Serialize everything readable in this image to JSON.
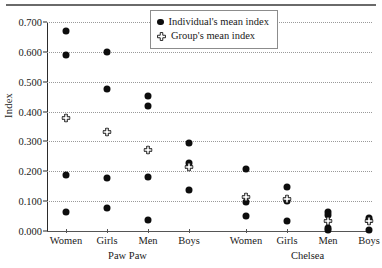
{
  "chart_data": {
    "type": "scatter",
    "title": "",
    "xlabel": "",
    "ylabel": "Index",
    "ylim": [
      0.0,
      0.7
    ],
    "yticks": [
      "0.000",
      "0.100",
      "0.200",
      "0.300",
      "0.400",
      "0.500",
      "0.600",
      "0.700"
    ],
    "ytick_values": [
      0.0,
      0.1,
      0.2,
      0.3,
      0.4,
      0.5,
      0.6,
      0.7
    ],
    "grid": true,
    "legend_position": "top-right",
    "legend": [
      {
        "key": "individual",
        "label": "Individual's mean index",
        "marker": "filled-circle"
      },
      {
        "key": "group",
        "label": "Group's mean index",
        "marker": "open-cross"
      }
    ],
    "site_groups": [
      {
        "name": "Paw Paw",
        "categories": [
          "Women",
          "Girls",
          "Men",
          "Boys"
        ]
      },
      {
        "name": "Chelsea",
        "categories": [
          "Women",
          "Girls",
          "Men",
          "Boys"
        ]
      }
    ],
    "categories": [
      {
        "site": "Paw Paw",
        "label": "Women",
        "individual_values": [
          0.67,
          0.59,
          0.188,
          0.065
        ],
        "group_value": 0.378
      },
      {
        "site": "Paw Paw",
        "label": "Girls",
        "individual_values": [
          0.6,
          0.477,
          0.178,
          0.078
        ],
        "group_value": 0.33
      },
      {
        "site": "Paw Paw",
        "label": "Men",
        "individual_values": [
          0.452,
          0.42,
          0.18,
          0.037
        ],
        "group_value": 0.27
      },
      {
        "site": "Paw Paw",
        "label": "Boys",
        "individual_values": [
          0.295,
          0.228,
          0.137
        ],
        "group_value": 0.213
      },
      {
        "site": "Chelsea",
        "label": "Women",
        "individual_values": [
          0.207,
          0.098,
          0.05
        ],
        "group_value": 0.113
      },
      {
        "site": "Chelsea",
        "label": "Girls",
        "individual_values": [
          0.148,
          0.1,
          0.032
        ],
        "group_value": 0.106
      },
      {
        "site": "Chelsea",
        "label": "Men",
        "individual_values": [
          0.065,
          0.055,
          0.01,
          0.004
        ],
        "group_value": 0.033
      },
      {
        "site": "Chelsea",
        "label": "Boys",
        "individual_values": [
          0.044,
          0.037,
          0.005
        ],
        "group_value": 0.034
      }
    ]
  },
  "colors": {
    "marker": "#0d0d0d",
    "grid": "#9a9a9a",
    "axis": "#2b2b2b",
    "legend_border": "#8c8c8c",
    "rule": "#6a6a6a"
  }
}
